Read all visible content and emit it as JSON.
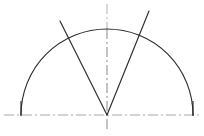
{
  "figure": {
    "canvas": {
      "width": 204,
      "height": 136,
      "background": "#ffffff"
    },
    "colors": {
      "outline": "#2b2b2b",
      "centerline": "#a8a8a8",
      "centerline_upper": "#b4b4b4",
      "centerline_lower": "#8f8f8f",
      "background": "#ffffff"
    },
    "geometry": {
      "center": {
        "x": 107,
        "y": 115
      },
      "radius": 86,
      "arc": {
        "start": {
          "x": 21,
          "y": 115
        },
        "end": {
          "x": 193,
          "y": 115
        },
        "apex": {
          "x": 107,
          "y": 29
        },
        "sweep_degrees": 180
      },
      "baseline": {
        "x1": 4,
        "y1": 115,
        "x2": 200,
        "y2": 115
      },
      "vertical_centerline": {
        "x": 107,
        "y_top": 4,
        "y_bottom": 130
      },
      "rays": [
        {
          "name": "left-ray",
          "from": {
            "x": 107,
            "y": 115
          },
          "to": {
            "x": 60,
            "y": 21
          },
          "angle_from_vertical_degrees": 26.6
        },
        {
          "name": "right-ray",
          "from": {
            "x": 107,
            "y": 115
          },
          "to": {
            "x": 149,
            "y": 11
          },
          "angle_from_vertical_degrees": 22.0
        }
      ],
      "end_ticks": [
        {
          "name": "left-end-tick",
          "x": 21,
          "y1": 101,
          "y2": 116
        },
        {
          "name": "right-end-tick",
          "x": 193,
          "y1": 101,
          "y2": 116
        }
      ]
    },
    "stroke": {
      "outline_width": 1.15,
      "centerline_width": 1.05,
      "centerline_dash": "10 3 2 3"
    }
  }
}
